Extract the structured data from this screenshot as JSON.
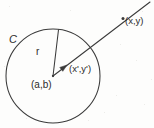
{
  "figure": {
    "kind": "geometry-diagram",
    "canvas": {
      "width": 154,
      "height": 128
    },
    "background_color": "#fdfdfc",
    "ink_color": "#3a3a3a",
    "labels": {
      "circle": "C",
      "radius": "r",
      "center_point": "(a,b)",
      "inner_point": "(x',y')",
      "outer_point": "(x,y)"
    },
    "geometry": {
      "circle": {
        "cx": 53,
        "cy": 76,
        "r": 47
      },
      "center_dot": {
        "cx": 53,
        "cy": 76
      },
      "radius_line": {
        "x1": 53,
        "y1": 76,
        "x2": 58.5,
        "y2": 29.7
      },
      "ray": {
        "x1": 53,
        "y1": 76,
        "x2": 150,
        "y2": 2
      },
      "inner_point_dot": {
        "cx": 67,
        "cy": 65
      },
      "outer_point_dot": {
        "cx": 123,
        "cy": 18.5
      }
    }
  }
}
